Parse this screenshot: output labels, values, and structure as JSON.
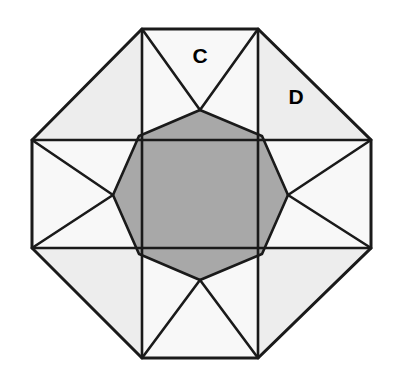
{
  "figure": {
    "width": 393,
    "height": 380,
    "background_color": "#ffffff"
  },
  "colors": {
    "stroke": "#1a1a1a",
    "inner_octagon_fill": "#a8a8a8",
    "corner_triangle_fill": "#ededed",
    "edge_square_fill": "#f8f8f8",
    "star_point_fill": "#ffffff",
    "label_color": "#000000"
  },
  "labels": [
    {
      "id": "label-c",
      "text": "C",
      "x": 200,
      "y": 57
    },
    {
      "id": "label-d",
      "text": "D",
      "x": 296,
      "y": 98
    }
  ],
  "geometry": {
    "stroke_width": 2.6,
    "outer_octagon": {
      "name": "outer-octagon",
      "points": "142,29 258,29 371,140 371,248 258,358 142,358 32,248 32,140"
    },
    "inner_octagon": {
      "name": "inner-octagon",
      "points": "200,110 262,136 288,195 262,254 200,280 139,254 113,195 139,136"
    },
    "corner_triangles": [
      {
        "name": "corner-triangle-top-left",
        "points": "142,29 32,140 142,140"
      },
      {
        "name": "corner-triangle-top-right",
        "points": "258,29 258,140 371,140"
      },
      {
        "name": "corner-triangle-bottom-right",
        "points": "371,248 258,248 258,358"
      },
      {
        "name": "corner-triangle-bottom-left",
        "points": "32,248 142,248 142,358"
      }
    ],
    "edge_squares": [
      {
        "name": "edge-square-top",
        "points": "142,29 258,29 258,140 142,140"
      },
      {
        "name": "edge-square-right",
        "points": "258,140 371,140 371,248 258,248"
      },
      {
        "name": "edge-square-bottom",
        "points": "142,248 258,248 258,358 142,358"
      },
      {
        "name": "edge-square-left",
        "points": "32,140 142,140 142,248 32,248"
      }
    ],
    "star_points": [
      {
        "name": "star-point-top",
        "points": "142,140 258,140 200,110"
      },
      {
        "name": "star-point-right",
        "points": "258,140 258,248 288,195"
      },
      {
        "name": "star-point-bottom",
        "points": "142,248 258,248 200,280"
      },
      {
        "name": "star-point-left",
        "points": "142,140 142,248 113,195"
      }
    ],
    "fan_lines": [
      {
        "name": "fan-line-top-left",
        "d": "M 142,29 L 200,110"
      },
      {
        "name": "fan-line-top-right",
        "d": "M 258,29 L 200,110"
      },
      {
        "name": "fan-line-right-top",
        "d": "M 371,140 L 288,195"
      },
      {
        "name": "fan-line-right-bottom",
        "d": "M 371,248 L 288,195"
      },
      {
        "name": "fan-line-bottom-right",
        "d": "M 258,358 L 200,280"
      },
      {
        "name": "fan-line-bottom-left",
        "d": "M 142,358 L 200,280"
      },
      {
        "name": "fan-line-left-bottom",
        "d": "M 32,248 L 113,195"
      },
      {
        "name": "fan-line-left-top",
        "d": "M 32,140 L 113,195"
      }
    ],
    "chord_lines": [
      {
        "name": "chord-line-top",
        "d": "M 142,140 L 258,140"
      },
      {
        "name": "chord-line-right",
        "d": "M 258,140 L 258,248"
      },
      {
        "name": "chord-line-bottom",
        "d": "M 142,248 L 258,248"
      },
      {
        "name": "chord-line-left",
        "d": "M 142,140 L 142,248"
      }
    ],
    "corner_cut_lines": [
      {
        "name": "corner-cut-top-left",
        "d": "M 142,29 L 142,140"
      },
      {
        "name": "corner-cut-top-right",
        "d": "M 258,29 L 258,140"
      },
      {
        "name": "corner-cut-right-top",
        "d": "M 371,140 L 258,140"
      },
      {
        "name": "corner-cut-right-bottom",
        "d": "M 371,248 L 258,248"
      },
      {
        "name": "corner-cut-bottom-right",
        "d": "M 258,358 L 258,248"
      },
      {
        "name": "corner-cut-bottom-left",
        "d": "M 142,358 L 142,248"
      },
      {
        "name": "corner-cut-left-bottom",
        "d": "M 32,248 L 142,248"
      },
      {
        "name": "corner-cut-left-top",
        "d": "M 32,140 L 142,140"
      }
    ]
  }
}
